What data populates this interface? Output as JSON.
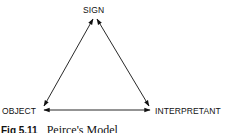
{
  "diagram": {
    "type": "triangle",
    "nodes": [
      {
        "id": "sign",
        "label": "SIGN"
      },
      {
        "id": "object",
        "label": "OBJECT"
      },
      {
        "id": "interpretant",
        "label": "INTERPRETANT"
      }
    ],
    "edges": [
      {
        "from": "sign",
        "to": "object",
        "bidirectional": true
      },
      {
        "from": "sign",
        "to": "interpretant",
        "bidirectional": true
      },
      {
        "from": "object",
        "to": "interpretant",
        "bidirectional": true
      }
    ]
  },
  "caption": {
    "figure": "Fig 5.11",
    "title": "Peirce's Model"
  },
  "colors": {
    "line": "#111111",
    "text": "#111111",
    "background": "#ffffff"
  }
}
